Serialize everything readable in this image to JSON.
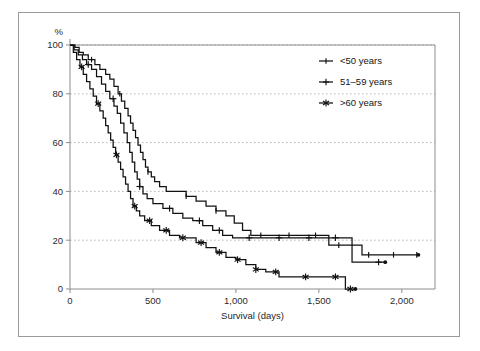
{
  "figure": {
    "y_unit_label": "%",
    "xlabel": "Survival (days)",
    "border": "#9a9a9a"
  },
  "legend": {
    "position": "top-right",
    "entries": [
      {
        "label": "<50 years",
        "marker": "line-tick"
      },
      {
        "label": "51–59 years",
        "marker": "plus"
      },
      {
        "label": ">60 years",
        "marker": "asterisk"
      }
    ]
  },
  "chart_data": {
    "type": "line",
    "subtype": "kaplan-meier-step",
    "title": "",
    "xlabel": "Survival (days)",
    "ylabel": "%",
    "xlim": [
      0,
      2200
    ],
    "ylim": [
      0,
      100
    ],
    "xticks": [
      0,
      500,
      1000,
      1500,
      2000
    ],
    "xticklabels": [
      "0",
      "500",
      "1,000",
      "1,500",
      "2,000"
    ],
    "yticks": [
      0,
      20,
      40,
      60,
      80,
      100
    ],
    "yticklabels": [
      "0",
      "20",
      "40",
      "60",
      "80",
      "100"
    ],
    "grid": "horizontal-dotted",
    "legend_position": "top-right",
    "series": [
      {
        "name": "<50 years",
        "marker": "line-tick",
        "color": "#111111",
        "points": [
          [
            0,
            100
          ],
          [
            30,
            99
          ],
          [
            55,
            97
          ],
          [
            80,
            96
          ],
          [
            110,
            94
          ],
          [
            150,
            92
          ],
          [
            180,
            90
          ],
          [
            215,
            88
          ],
          [
            240,
            86
          ],
          [
            265,
            83
          ],
          [
            290,
            80
          ],
          [
            310,
            77
          ],
          [
            330,
            74
          ],
          [
            350,
            71
          ],
          [
            365,
            68
          ],
          [
            380,
            65
          ],
          [
            395,
            62
          ],
          [
            410,
            59
          ],
          [
            425,
            56
          ],
          [
            440,
            53
          ],
          [
            455,
            50
          ],
          [
            470,
            48
          ],
          [
            490,
            46
          ],
          [
            510,
            44
          ],
          [
            540,
            42
          ],
          [
            580,
            40
          ],
          [
            640,
            40
          ],
          [
            700,
            38
          ],
          [
            760,
            36
          ],
          [
            820,
            34
          ],
          [
            880,
            32
          ],
          [
            940,
            30
          ],
          [
            990,
            27
          ],
          [
            1040,
            24
          ],
          [
            1090,
            22
          ],
          [
            1140,
            22
          ],
          [
            1250,
            22
          ],
          [
            1380,
            22
          ],
          [
            1480,
            22
          ],
          [
            1560,
            18
          ],
          [
            1700,
            18
          ],
          [
            1760,
            14
          ],
          [
            2100,
            14
          ]
        ],
        "censor_marks": [
          130,
          300,
          470,
          700,
          880,
          1150,
          1320,
          1480,
          1620,
          1800,
          1950,
          2090
        ],
        "endpoint": {
          "x": 2100,
          "y": 14
        }
      },
      {
        "name": "51–59 years",
        "marker": "plus",
        "color": "#111111",
        "points": [
          [
            0,
            100
          ],
          [
            25,
            98
          ],
          [
            50,
            96
          ],
          [
            75,
            94
          ],
          [
            100,
            92
          ],
          [
            130,
            90
          ],
          [
            160,
            87
          ],
          [
            190,
            84
          ],
          [
            215,
            81
          ],
          [
            240,
            78
          ],
          [
            265,
            75
          ],
          [
            285,
            72
          ],
          [
            305,
            68
          ],
          [
            325,
            64
          ],
          [
            345,
            60
          ],
          [
            360,
            56
          ],
          [
            375,
            52
          ],
          [
            390,
            48
          ],
          [
            405,
            45
          ],
          [
            420,
            42
          ],
          [
            440,
            39
          ],
          [
            465,
            37
          ],
          [
            500,
            35
          ],
          [
            560,
            33
          ],
          [
            620,
            31
          ],
          [
            680,
            29
          ],
          [
            740,
            28
          ],
          [
            800,
            26
          ],
          [
            860,
            24
          ],
          [
            920,
            22
          ],
          [
            980,
            21
          ],
          [
            1050,
            21
          ],
          [
            1200,
            21
          ],
          [
            1350,
            21
          ],
          [
            1480,
            21
          ],
          [
            1620,
            21
          ],
          [
            1700,
            11
          ],
          [
            1900,
            11
          ]
        ],
        "censor_marks": [
          110,
          260,
          420,
          600,
          780,
          900,
          1080,
          1260,
          1440,
          1600,
          1860
        ],
        "endpoint": {
          "x": 1900,
          "y": 11
        }
      },
      {
        "name": ">60 years",
        "marker": "asterisk",
        "color": "#111111",
        "points": [
          [
            0,
            100
          ],
          [
            20,
            97
          ],
          [
            40,
            94
          ],
          [
            60,
            91
          ],
          [
            80,
            88
          ],
          [
            100,
            85
          ],
          [
            120,
            82
          ],
          [
            140,
            79
          ],
          [
            160,
            76
          ],
          [
            180,
            73
          ],
          [
            200,
            70
          ],
          [
            215,
            67
          ],
          [
            230,
            64
          ],
          [
            245,
            61
          ],
          [
            260,
            58
          ],
          [
            275,
            55
          ],
          [
            290,
            52
          ],
          [
            305,
            49
          ],
          [
            320,
            46
          ],
          [
            335,
            43
          ],
          [
            350,
            40
          ],
          [
            365,
            37
          ],
          [
            380,
            34
          ],
          [
            400,
            32
          ],
          [
            420,
            30
          ],
          [
            450,
            28
          ],
          [
            490,
            26
          ],
          [
            540,
            24
          ],
          [
            600,
            22
          ],
          [
            660,
            21
          ],
          [
            700,
            21
          ],
          [
            760,
            19
          ],
          [
            820,
            17
          ],
          [
            880,
            15
          ],
          [
            940,
            13
          ],
          [
            1000,
            12
          ],
          [
            1060,
            10
          ],
          [
            1120,
            8
          ],
          [
            1180,
            7
          ],
          [
            1260,
            5
          ],
          [
            1400,
            5
          ],
          [
            1560,
            5
          ],
          [
            1650,
            5
          ],
          [
            1660,
            0
          ],
          [
            1720,
            0
          ]
        ],
        "censor_marks": [
          70,
          170,
          280,
          390,
          480,
          580,
          680,
          790,
          900,
          1010,
          1120,
          1240,
          1420,
          1600,
          1690
        ],
        "endpoint": {
          "x": 1720,
          "y": 0
        }
      }
    ]
  }
}
